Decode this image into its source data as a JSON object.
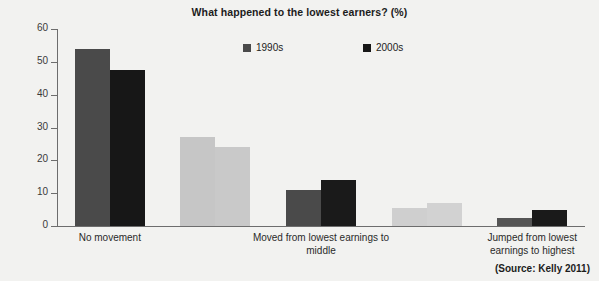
{
  "chart_data": {
    "type": "bar",
    "title": "What happened to the lowest earners? (%)",
    "xlabel": "",
    "ylabel": "",
    "ylim": [
      0,
      60
    ],
    "yticks": [
      0,
      10,
      20,
      30,
      40,
      50,
      60
    ],
    "grid": false,
    "legend_position": "top-center",
    "categories": [
      "No movement",
      "",
      "Moved from lowest earnings to middle",
      "",
      "Jumped from lowest earnings to highest"
    ],
    "visible_category_labels": [
      {
        "line1": "No movement",
        "line2": ""
      },
      {
        "line1": "Moved from lowest earnings to",
        "line2": "middle"
      },
      {
        "line1": "Jumped from lowest",
        "line2": "earnings to highest"
      }
    ],
    "series": [
      {
        "name": "1990s",
        "values": [
          54,
          27,
          11,
          5.5,
          2.5
        ],
        "color": "#4a4a4a"
      },
      {
        "name": "2000s",
        "values": [
          47.5,
          24,
          14,
          7,
          5
        ],
        "color": "#171717"
      }
    ],
    "group_shading": [
      {
        "s1": "#4a4a4a",
        "s2": "#171717"
      },
      {
        "s1": "#c6c6c6",
        "s2": "#c9c9c9"
      },
      {
        "s1": "#4a4a4a",
        "s2": "#1a1a1a"
      },
      {
        "s1": "#cfcfcf",
        "s2": "#d2d2d2"
      },
      {
        "s1": "#555555",
        "s2": "#1a1a1a"
      }
    ],
    "source": "(Source: Kelly 2011)"
  },
  "legend": {
    "items": [
      {
        "label": "1990s",
        "color": "#4a4a4a"
      },
      {
        "label": "2000s",
        "color": "#171717"
      }
    ]
  }
}
